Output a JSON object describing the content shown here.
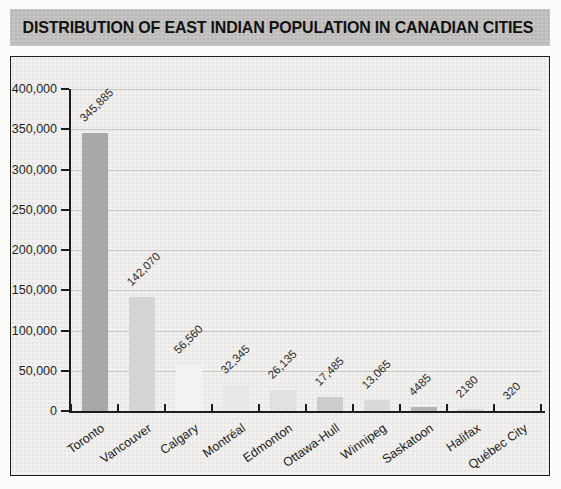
{
  "figure": {
    "header": {
      "title": "DISTRIBUTION OF EAST INDIAN POPULATION IN CANADIAN CITIES"
    }
  },
  "chart_data": {
    "type": "bar",
    "title": "DISTRIBUTION OF EAST INDIAN POPULATION IN CANADIAN CITIES",
    "xlabel": "",
    "ylabel": "",
    "categories": [
      "Toronto",
      "Vancouver",
      "Calgary",
      "Montréal",
      "Edmonton",
      "Ottawa-Hull",
      "Winnipeg",
      "Saskatoon",
      "Halifax",
      "Québec City"
    ],
    "values": [
      345885,
      142070,
      56560,
      32345,
      26135,
      17485,
      13065,
      4485,
      2180,
      320
    ],
    "value_labels": [
      "345,885",
      "142,070",
      "56,560",
      "32,345",
      "26,135",
      "17,485",
      "13,065",
      "4485",
      "2180",
      "320"
    ],
    "bar_colors": [
      "#a9a8a6",
      "#d5d4d2",
      "#f3f2f0",
      "#e9e8e6",
      "#e2e1df",
      "#cdccca",
      "#dbdad8",
      "#b5b4b2",
      "#d9d8d6",
      "#e6e5e3"
    ],
    "ylim": [
      0,
      400000
    ],
    "ytick_interval": 50000,
    "ytick_labels": [
      "0",
      "50,000",
      "100,000",
      "150,000",
      "200,000",
      "250,000",
      "300,000",
      "350,000",
      "400,000"
    ],
    "grid": "horizontal",
    "legend": "none"
  },
  "colors": {
    "header_bg": "#c5c3c1",
    "chart_bg": "#f1f0ee",
    "gridline": "#c6c6c4",
    "axis": "#1c1c1c",
    "label_text": "#1f1f1f"
  }
}
